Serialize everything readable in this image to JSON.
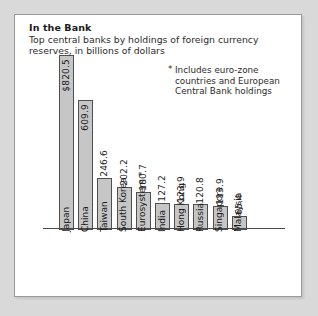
{
  "panel": {
    "title": "In the Bank",
    "subtitle": "Top central banks by holdings of foreign currency reserves, in billions of dollars",
    "footnote_marker": "*",
    "footnote": "Includes euro-zone countries and European Central Bank holdings"
  },
  "chart_data": {
    "type": "bar",
    "title": "In the Bank",
    "subtitle": "Top central banks by holdings of foreign currency reserves, in billions of dollars",
    "xlabel": "",
    "ylabel": "",
    "ylim": [
      0,
      860
    ],
    "grid": false,
    "legend": null,
    "units": "billions of dollars",
    "annotations": [
      "*Includes euro-zone countries and European Central Bank holdings"
    ],
    "categories": [
      "Japan",
      "China",
      "Taiwan",
      "South Korea",
      "Eurosystem *",
      "India",
      "Hong Kong",
      "Russia",
      "Singapore",
      "Malaysia"
    ],
    "categories_full": [
      "Japan",
      "China",
      "Taiwan",
      "South Korea",
      "Eurosystem *",
      "India",
      "Hong Kong",
      "Russia",
      "Singapore",
      "Malaysia"
    ],
    "values": [
      820.5,
      609.9,
      246.6,
      202.2,
      180.7,
      127.2,
      123.9,
      120.8,
      113.9,
      65.4
    ],
    "value_labels": [
      "$820.5",
      "609.9",
      "246.6",
      "202.2",
      "180.7",
      "127.2",
      "123.9",
      "120.8",
      "113.9",
      "65.4"
    ],
    "colors": {
      "bar_fill": "#c6c6c6",
      "bar_stroke": "#4f4f4f",
      "panel_bg": "#ffffff",
      "page_bg": "#d9d9d9",
      "text": "#1a1a1a"
    }
  }
}
